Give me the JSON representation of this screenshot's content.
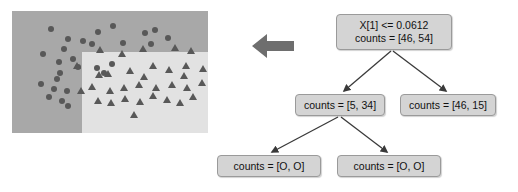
{
  "figure": {
    "background_color": "#ffffff",
    "arrow_color": "#6e6e6e",
    "arrow_icon": "left-arrow-icon"
  },
  "scatter": {
    "panel_background": "#a8a8a8",
    "split_region_background": "#e2e2e2",
    "marker_color": "#585858",
    "circle_label": "class-0-circle",
    "triangle_label": "class-1-triangle",
    "circles": [
      [
        39,
        18
      ],
      [
        56,
        28
      ],
      [
        86,
        21
      ],
      [
        71,
        30
      ],
      [
        101,
        15
      ],
      [
        80,
        33
      ],
      [
        111,
        32
      ],
      [
        133,
        22
      ],
      [
        143,
        19
      ],
      [
        156,
        27
      ],
      [
        139,
        33
      ],
      [
        52,
        38
      ],
      [
        31,
        43
      ],
      [
        61,
        48
      ],
      [
        47,
        51
      ],
      [
        66,
        56
      ],
      [
        48,
        62
      ],
      [
        45,
        68
      ],
      [
        29,
        73
      ],
      [
        42,
        78
      ],
      [
        55,
        80
      ],
      [
        37,
        86
      ],
      [
        50,
        90
      ],
      [
        56,
        95
      ],
      [
        85,
        57
      ],
      [
        92,
        62
      ],
      [
        100,
        53
      ]
    ],
    "triangles": [
      [
        65,
        55
      ],
      [
        69,
        80
      ],
      [
        88,
        39
      ],
      [
        110,
        43
      ],
      [
        131,
        38
      ],
      [
        163,
        37
      ],
      [
        179,
        40
      ],
      [
        96,
        63
      ],
      [
        118,
        60
      ],
      [
        141,
        55
      ],
      [
        157,
        59
      ],
      [
        174,
        55
      ],
      [
        191,
        58
      ],
      [
        87,
        64
      ],
      [
        132,
        66
      ],
      [
        172,
        65
      ],
      [
        80,
        76
      ],
      [
        98,
        80
      ],
      [
        112,
        77
      ],
      [
        127,
        74
      ],
      [
        144,
        77
      ],
      [
        160,
        74
      ],
      [
        175,
        77
      ],
      [
        190,
        72
      ],
      [
        86,
        90
      ],
      [
        99,
        92
      ],
      [
        113,
        88
      ],
      [
        128,
        91
      ],
      [
        141,
        85
      ],
      [
        155,
        89
      ],
      [
        168,
        92
      ],
      [
        181,
        86
      ],
      [
        122,
        104
      ]
    ]
  },
  "tree": {
    "node_fill": "#d4d4d4",
    "node_border": "#9a9a9a",
    "edge_color": "#3a3a3a",
    "root": {
      "name": "root-node",
      "condition": "X[1] <= 0.0612",
      "counts": "counts = [46, 54]"
    },
    "level1": [
      {
        "name": "node-left",
        "counts": "counts = [5, 34]"
      },
      {
        "name": "node-right",
        "counts": "counts = [46, 15]"
      }
    ],
    "level2": [
      {
        "name": "leaf-left",
        "counts": "counts = [O, O]"
      },
      {
        "name": "leaf-right",
        "counts": "counts = [O, O]"
      }
    ]
  }
}
